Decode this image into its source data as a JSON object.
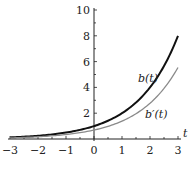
{
  "chart_data": {
    "type": "line",
    "title": "",
    "xlabel": "t",
    "ylabel": "",
    "xlim": [
      -3,
      3
    ],
    "ylim": [
      0,
      10
    ],
    "x_ticks": [
      -3,
      -2,
      -1,
      0,
      1,
      2,
      3
    ],
    "x_tick_labels": [
      "−3",
      "−2",
      "−1",
      "0",
      "1",
      "2",
      "3"
    ],
    "y_ticks": [
      2,
      4,
      6,
      8,
      10
    ],
    "y_tick_labels": [
      "2",
      "4",
      "6",
      "8",
      "10"
    ],
    "grid": false,
    "legend": "inline labels on curves",
    "x": [
      -3,
      -2.5,
      -2,
      -1.5,
      -1,
      -0.5,
      0,
      0.5,
      1,
      1.5,
      2,
      2.5,
      3
    ],
    "series": [
      {
        "name": "b(t)",
        "color": "#111111",
        "values": [
          0.125,
          0.177,
          0.25,
          0.354,
          0.5,
          0.707,
          1.0,
          1.414,
          2.0,
          2.828,
          4.0,
          5.657,
          8.0
        ]
      },
      {
        "name": "b′(t)",
        "color": "#8a8a8a",
        "values": [
          0.087,
          0.123,
          0.173,
          0.245,
          0.347,
          0.49,
          0.693,
          0.98,
          1.386,
          1.961,
          2.773,
          3.921,
          5.545
        ]
      }
    ],
    "annotations": [
      {
        "text": "b(t)",
        "x": 2.2,
        "y": 5.5
      },
      {
        "text": "b′(t)",
        "x": 2.5,
        "y": 1.4
      }
    ]
  },
  "labels": {
    "axis_t": "t",
    "b": "b(t)",
    "bprime": "b′(t)"
  }
}
